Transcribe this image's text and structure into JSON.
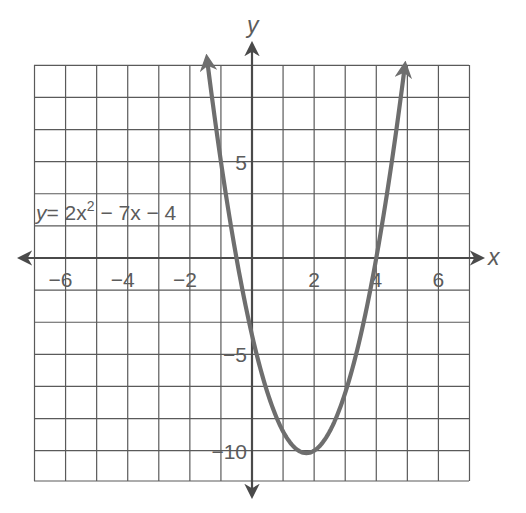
{
  "chart_data": {
    "type": "line",
    "title": "",
    "equation_label": {
      "y": "y",
      "eq": "= 2x",
      "exp": "2",
      "rest": " − 7x − 4"
    },
    "xlabel": "x",
    "ylabel": "y",
    "xlim": [
      -7,
      7
    ],
    "ylim": [
      -11.6,
      10
    ],
    "grid": true,
    "x_grid_step": 1,
    "y_grid_step": 1.6667,
    "x_ticks": [
      {
        "value": -6,
        "label": "−6"
      },
      {
        "value": -4,
        "label": "−4"
      },
      {
        "value": -2,
        "label": "−2"
      },
      {
        "value": 2,
        "label": "2"
      },
      {
        "value": 4,
        "label": "4"
      },
      {
        "value": 6,
        "label": "6"
      }
    ],
    "y_ticks": [
      {
        "value": 5,
        "label": "5"
      },
      {
        "value": -5,
        "label": "−5"
      },
      {
        "value": -10,
        "label": "−10"
      }
    ],
    "series": [
      {
        "name": "y = 2x^2 − 7x − 4",
        "function": "2x^2 - 7x - 4",
        "x_range": [
          -1.42,
          4.92
        ],
        "key_points": {
          "vertex": [
            1.75,
            -10.125
          ],
          "x_intercepts": [
            -0.5,
            4
          ],
          "y_intercept": [
            0,
            -4
          ]
        },
        "color": "#6e6e6e"
      }
    ]
  }
}
